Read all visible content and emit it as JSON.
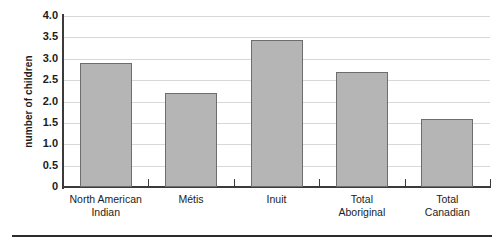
{
  "chart_data": {
    "type": "bar",
    "title": "",
    "xlabel": "",
    "ylabel": "number of children",
    "categories": [
      "North American Indian",
      "Métis",
      "Inuit",
      "Total Aboriginal",
      "Total Canadian"
    ],
    "category_lines": [
      [
        "North American",
        "Indian"
      ],
      [
        "Métis",
        ""
      ],
      [
        "Inuit",
        ""
      ],
      [
        "Total",
        "Aboriginal"
      ],
      [
        "Total",
        "Canadian"
      ]
    ],
    "values": [
      2.9,
      2.2,
      3.45,
      2.7,
      1.6
    ],
    "ylim": [
      0,
      4.0
    ],
    "yticks": [
      0,
      0.5,
      1.0,
      1.5,
      2.0,
      2.5,
      3.0,
      3.5,
      4.0
    ],
    "ytick_labels": [
      "0",
      "0.5",
      "1.0",
      "1.5",
      "2.0",
      "2.5",
      "3.0",
      "3.5",
      "4.0"
    ],
    "grid": true,
    "legend": "none",
    "bar_color": "#b5b5b5",
    "bar_edge_color": "#6d6d6d",
    "axis_color": "#3b3b3b",
    "grid_color": "#d8d8d8"
  }
}
